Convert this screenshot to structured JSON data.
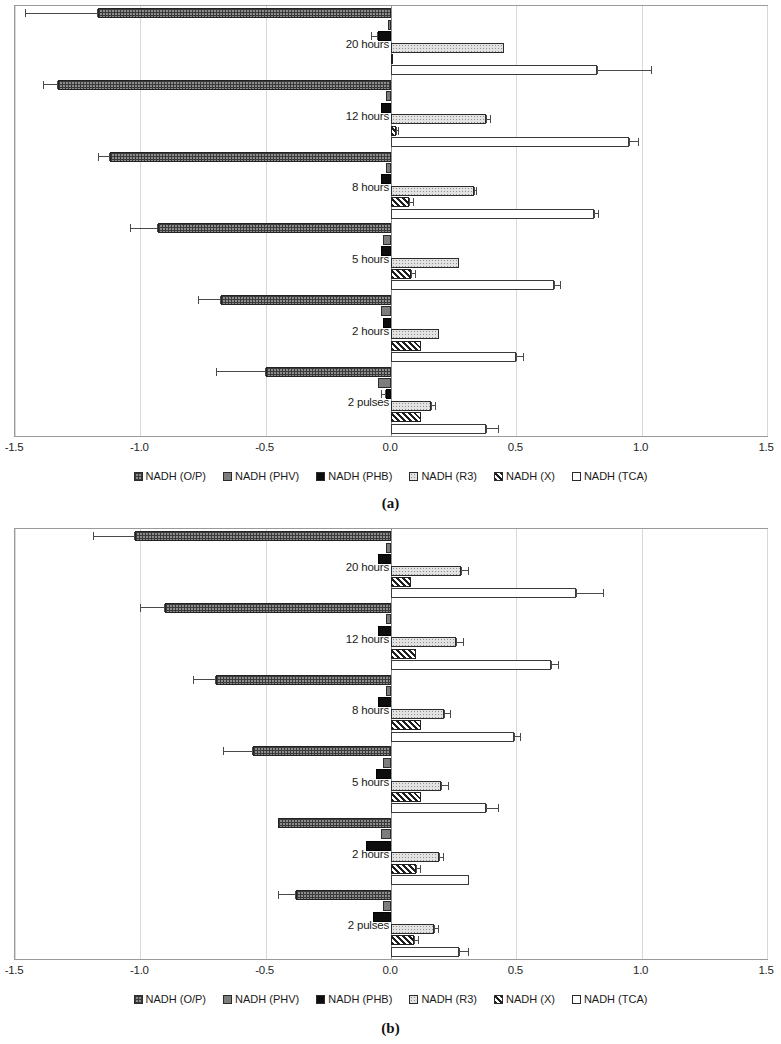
{
  "figure": {
    "panel_a_caption": "(a)",
    "panel_b_caption": "(b)"
  },
  "axis": {
    "ticks": [
      "-1.5",
      "-1.0",
      "-0.5",
      "0.0",
      "0.5",
      "1.0",
      "1.5"
    ],
    "min": -1.5,
    "max": 1.5
  },
  "legend": {
    "items": [
      {
        "label": "NADH (O/P)",
        "pattern": "p-op"
      },
      {
        "label": "NADH (PHV)",
        "pattern": "p-phv"
      },
      {
        "label": "NADH (PHB)",
        "pattern": "p-phb"
      },
      {
        "label": "NADH (R3)",
        "pattern": "p-r3"
      },
      {
        "label": "NADH (X)",
        "pattern": "p-x"
      },
      {
        "label": "NADH (TCA)",
        "pattern": "p-tca"
      }
    ]
  },
  "chart_data": [
    {
      "type": "bar",
      "orientation": "horizontal",
      "panel": "(a)",
      "title": "",
      "xlabel": "",
      "ylabel": "",
      "xlim": [
        -1.5,
        1.5
      ],
      "grid": true,
      "legend_position": "bottom",
      "categories": [
        "20 hours",
        "12 hours",
        "8 hours",
        "5 hours",
        "2 hours",
        "2 pulses"
      ],
      "series": [
        {
          "name": "NADH (O/P)",
          "pattern": "p-op",
          "values": [
            -1.17,
            -1.33,
            -1.12,
            -0.93,
            -0.68,
            -0.5
          ],
          "errors": [
            0.29,
            0.06,
            0.05,
            0.11,
            0.09,
            0.2
          ]
        },
        {
          "name": "NADH (PHV)",
          "pattern": "p-phv",
          "values": [
            -0.01,
            -0.02,
            -0.02,
            -0.03,
            -0.04,
            -0.05
          ],
          "errors": [
            0,
            0,
            0,
            0,
            0,
            0
          ]
        },
        {
          "name": "NADH (PHB)",
          "pattern": "p-phb",
          "values": [
            -0.05,
            -0.04,
            -0.04,
            -0.04,
            -0.03,
            -0.02
          ],
          "errors": [
            0.03,
            0,
            0,
            0,
            0,
            0.02
          ]
        },
        {
          "name": "NADH (R3)",
          "pattern": "p-r3",
          "values": [
            0.45,
            0.38,
            0.33,
            0.27,
            0.19,
            0.16
          ],
          "errors": [
            0.0,
            0.02,
            0.01,
            0.0,
            0.0,
            0.02
          ]
        },
        {
          "name": "NADH (X)",
          "pattern": "p-x",
          "values": [
            0.0,
            0.02,
            0.07,
            0.08,
            0.12,
            0.12
          ],
          "errors": [
            0.0,
            0.01,
            0.02,
            0.02,
            0.0,
            0.0
          ]
        },
        {
          "name": "NADH (TCA)",
          "pattern": "p-tca",
          "values": [
            0.82,
            0.95,
            0.81,
            0.65,
            0.5,
            0.38
          ],
          "errors": [
            0.22,
            0.04,
            0.02,
            0.03,
            0.03,
            0.05
          ]
        }
      ]
    },
    {
      "type": "bar",
      "orientation": "horizontal",
      "panel": "(b)",
      "title": "",
      "xlabel": "",
      "ylabel": "",
      "xlim": [
        -1.5,
        1.5
      ],
      "grid": true,
      "legend_position": "bottom",
      "categories": [
        "20 hours",
        "12 hours",
        "8 hours",
        "5 hours",
        "2 hours",
        "2 pulses"
      ],
      "series": [
        {
          "name": "NADH (O/P)",
          "pattern": "p-op",
          "values": [
            -1.02,
            -0.9,
            -0.7,
            -0.55,
            -0.45,
            -0.38
          ],
          "errors": [
            0.17,
            0.1,
            0.09,
            0.12,
            0.0,
            0.07
          ]
        },
        {
          "name": "NADH (PHV)",
          "pattern": "p-phv",
          "values": [
            -0.02,
            -0.02,
            -0.02,
            -0.03,
            -0.04,
            -0.03
          ],
          "errors": [
            0,
            0,
            0,
            0,
            0,
            0
          ]
        },
        {
          "name": "NADH (PHB)",
          "pattern": "p-phb",
          "values": [
            -0.05,
            -0.05,
            -0.05,
            -0.06,
            -0.1,
            -0.07
          ],
          "errors": [
            0,
            0,
            0,
            0,
            0,
            0
          ]
        },
        {
          "name": "NADH (R3)",
          "pattern": "p-r3",
          "values": [
            0.28,
            0.26,
            0.21,
            0.2,
            0.19,
            0.17
          ],
          "errors": [
            0.03,
            0.03,
            0.03,
            0.03,
            0.02,
            0.02
          ]
        },
        {
          "name": "NADH (X)",
          "pattern": "p-x",
          "values": [
            0.08,
            0.1,
            0.12,
            0.12,
            0.1,
            0.09
          ],
          "errors": [
            0.0,
            0.0,
            0.0,
            0.0,
            0.02,
            0.02
          ]
        },
        {
          "name": "NADH (TCA)",
          "pattern": "p-tca",
          "values": [
            0.74,
            0.64,
            0.49,
            0.38,
            0.31,
            0.27
          ],
          "errors": [
            0.11,
            0.03,
            0.03,
            0.05,
            0.0,
            0.04
          ]
        }
      ]
    }
  ]
}
